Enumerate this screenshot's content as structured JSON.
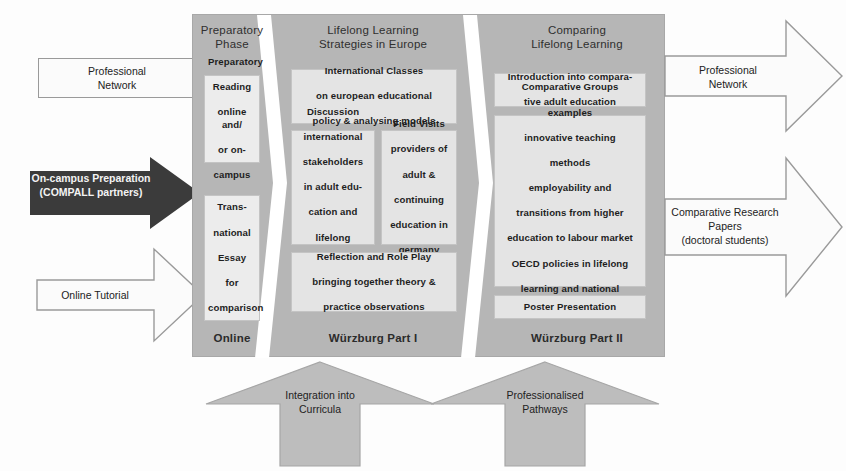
{
  "diagram": {
    "colors": {
      "panel_gray": "#b6b6b6",
      "card_gray": "#e4e4e4",
      "dark_arrow": "#3b3b3b",
      "white_arrow": "#fbfbfb",
      "bottom_arrow": "#bdbdbd"
    }
  },
  "inputs": {
    "professional_network": "Professional\nNetwork",
    "professional_network_line1": "Professional",
    "professional_network_line2": "Network",
    "on_campus_line1": "On-campus Preparation",
    "on_campus_line2": "(COMPALL partners)",
    "online_tutorial": "Online Tutorial"
  },
  "outputs": {
    "professional_network_line1": "Professional",
    "professional_network_line2": "Network",
    "comparative_papers_line1": "Comparative Research",
    "comparative_papers_line2": "Papers",
    "comparative_papers_line3": "(doctoral students)"
  },
  "columns": [
    {
      "id": "preparatory-phase",
      "title_line1": "Preparatory",
      "title_line2": "Phase",
      "footer": "Online",
      "cards": [
        {
          "id": "preparatory-reading",
          "lines": [
            "Preparatory",
            "Reading",
            "online and/",
            "or on-",
            "campus"
          ]
        },
        {
          "id": "transnational-essay",
          "lines": [
            "Trans-",
            "national",
            "Essay",
            "for",
            "comparison"
          ]
        }
      ]
    },
    {
      "id": "lifelong-learning-strategies",
      "title_line1": "Lifelong Learning",
      "title_line2": "Strategies in Europe",
      "footer": "Würzburg Part I",
      "cards": [
        {
          "id": "international-classes",
          "lines": [
            "International Classes",
            "on european educational",
            "policy & analysing models"
          ]
        },
        {
          "id": "discussion-stakeholders",
          "lines": [
            "Discussion",
            "international",
            "stakeholders",
            "in adult edu-",
            "cation and",
            "lifelong",
            "learning"
          ]
        },
        {
          "id": "field-visits",
          "lines": [
            "Field Visits",
            "providers of",
            "adult &",
            "continuing",
            "education in",
            "germany"
          ]
        },
        {
          "id": "reflection-role-play",
          "lines": [
            "Reflection and Role Play",
            "bringing together theory &",
            "practice observations"
          ]
        }
      ]
    },
    {
      "id": "comparing-lifelong-learning",
      "title_line1": "Comparing",
      "title_line2": "Lifelong Learning",
      "footer": "Würzburg Part II",
      "cards": [
        {
          "id": "introduction-comparative",
          "lines": [
            "Introduction into compara-",
            "tive adult education"
          ]
        },
        {
          "id": "comparative-groups",
          "lines": [
            "Comparative Groups",
            "examples",
            "innovative teaching",
            "methods",
            "employability and",
            "transitions from higher",
            "education to labour market",
            "OECD policies in lifelong",
            "learning and national",
            "implementations"
          ]
        },
        {
          "id": "poster-presentation",
          "lines": [
            "Poster Presentation"
          ]
        }
      ]
    }
  ],
  "bottom_arrows": [
    {
      "id": "integration-into-curricula",
      "line1": "Integration into",
      "line2": "Curricula"
    },
    {
      "id": "professionalised-pathways",
      "line1": "Professionalised",
      "line2": "Pathways"
    }
  ]
}
